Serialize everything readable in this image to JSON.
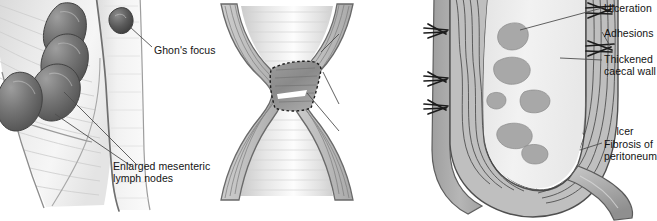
{
  "figure": {
    "panel_count": 3,
    "style": "grayscale medical line illustration"
  },
  "colors": {
    "background": "#ffffff",
    "label_text": "#131313",
    "leader_line": "#555555",
    "outline_dark": "#4a4a4a",
    "wall_gray": "#b9b9b9",
    "wall_gray_dark": "#9a9a9a",
    "lumen_light": "#ededed",
    "node_dark": "#6d6d6d",
    "node_darkest": "#4b4b4b",
    "ulcer_patch": "#a9a9a9",
    "mesentery_light": "#e8e8e8"
  },
  "panels": {
    "left": {
      "name": "mesenteric-lymph-nodes-panel",
      "labels": [
        {
          "id": "ghon",
          "text": "Ghon's focus"
        },
        {
          "id": "nodes",
          "line1": "Enlarged mesenteric",
          "line2": "lymph nodes"
        }
      ],
      "features": {
        "ghon_focus": "small dark caseating nodule on bowel wall",
        "lymph_nodes": "four enlarged teardrop-shaped dark nodes in mesentery",
        "mesentery": "fan-shaped mesentery with radiating fold lines"
      }
    },
    "middle": {
      "name": "intestinal-stricture-panel",
      "labels": [
        {
          "id": "thickened-wall",
          "line1": "Thickened",
          "line2": "wall"
        },
        {
          "id": "stricture",
          "text": "Stricture"
        },
        {
          "id": "transverse-ulcer",
          "text": "Transverse ulcer"
        }
      ],
      "features": {
        "shape": "hourglass narrowing of small bowel",
        "stricture_region": "dashed-outline diamond at narrowest point",
        "ulcer": "transverse ulcer within stricture"
      }
    },
    "right": {
      "name": "caecal-tuberculosis-panel",
      "labels": [
        {
          "id": "ulceration",
          "text": "Ulceration"
        },
        {
          "id": "adhesions",
          "text": "Adhesions"
        },
        {
          "id": "thickened-caecal-wall",
          "line1": "Thickened",
          "line2": "caecal wall"
        },
        {
          "id": "fibrosis",
          "line1": "Fibrosis of",
          "line2": "peritoneum"
        }
      ],
      "features": {
        "organ": "caecum opened longitudinally with appendix",
        "ulcers": "multiple irregular mucosal ulcer patches in lumen",
        "adhesions": "short bristle-like serosal adhesion strands",
        "wall": "markedly thickened caecal wall with wavy fibrous texture"
      }
    }
  },
  "captions": {
    "a": "",
    "b": "",
    "c": ""
  }
}
